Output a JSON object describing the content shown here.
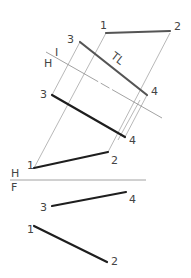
{
  "diagram": {
    "type": "descriptive-geometry-auxiliary-view",
    "colors": {
      "bold_line": "#1e1e1e",
      "tl_line": "#555555",
      "projection_line": "#9a9a9a",
      "label": "#444444"
    },
    "fold_lines": [
      {
        "id": "H-F",
        "upper_label": "H",
        "lower_label": "F"
      },
      {
        "id": "H-1",
        "upper_label": "I",
        "lower_label": "H"
      }
    ],
    "views": {
      "auxiliary": {
        "line_12": {
          "p1": "1",
          "p2": "2"
        },
        "line_34": {
          "p1": "3",
          "p2": "4",
          "annotation": "TL"
        }
      },
      "horizontal": {
        "line_12": {
          "p1": "1",
          "p2": "2"
        },
        "line_34": {
          "p1": "3",
          "p2": "4"
        }
      },
      "front": {
        "line_34": {
          "p1": "3",
          "p2": "4"
        },
        "line_12": {
          "p1": "1",
          "p2": "2"
        }
      }
    }
  }
}
